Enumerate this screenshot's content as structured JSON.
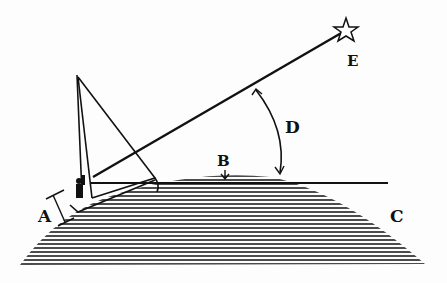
{
  "diagram": {
    "labels": {
      "A": "A",
      "B": "B",
      "C": "C",
      "D": "D",
      "E": "E"
    },
    "elements": [
      {
        "id": "A",
        "meaning": "height of observer's eye above sea"
      },
      {
        "id": "B",
        "meaning": "horizon point on sea"
      },
      {
        "id": "C",
        "meaning": "curved sea surface"
      },
      {
        "id": "D",
        "meaning": "angle between star and horizon"
      },
      {
        "id": "E",
        "meaning": "star"
      }
    ],
    "colors": {
      "ink": "#111111",
      "paper": "#fdfdfd"
    }
  }
}
